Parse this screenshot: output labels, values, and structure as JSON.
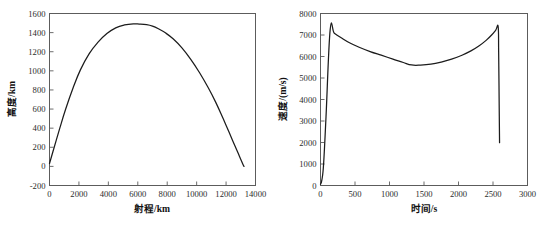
{
  "figure": {
    "background_color": "#ffffff",
    "axis_color": "#5c5c5c",
    "curve_color": "#1c1c1c",
    "panel_count": 2
  },
  "chart_data": [
    {
      "type": "line",
      "panel": "left",
      "title": "",
      "xlabel": "射程/km",
      "ylabel": "高度/km",
      "xlim": [
        0,
        14000
      ],
      "ylim": [
        -200,
        1600
      ],
      "xticks": [
        0,
        2000,
        4000,
        6000,
        8000,
        10000,
        12000,
        14000
      ],
      "yticks": [
        -200,
        0,
        200,
        400,
        600,
        800,
        1000,
        1200,
        1400,
        1600
      ],
      "xticklabels": [
        "0",
        "2000",
        "4000",
        "6000",
        "8000",
        "10000",
        "12000",
        "14000"
      ],
      "yticklabels": [
        "-200",
        "0",
        "200",
        "400",
        "600",
        "800",
        "1000",
        "1200",
        "1400",
        "1600"
      ],
      "grid": false,
      "legend": null,
      "series": [
        {
          "name": "弹道高度",
          "x": [
            0,
            300,
            700,
            1100,
            1600,
            2100,
            2700,
            3300,
            3900,
            4500,
            5100,
            5700,
            6100,
            6600,
            7000,
            7400,
            7900,
            8400,
            9000,
            9600,
            10200,
            10800,
            11300,
            11800,
            12200,
            12600,
            12900,
            13150,
            13220
          ],
          "y": [
            30,
            190,
            400,
            600,
            820,
            1010,
            1180,
            1300,
            1390,
            1450,
            1480,
            1492,
            1490,
            1483,
            1468,
            1440,
            1395,
            1335,
            1240,
            1120,
            980,
            820,
            670,
            500,
            360,
            215,
            110,
            20,
            0
          ]
        }
      ]
    },
    {
      "type": "line",
      "panel": "right",
      "title": "",
      "xlabel": "时间/s",
      "ylabel": "速度/(m/s)",
      "xlim": [
        0,
        3000
      ],
      "ylim": [
        0,
        8000
      ],
      "xticks": [
        0,
        500,
        1000,
        1500,
        2000,
        2500,
        3000
      ],
      "yticks": [
        0,
        1000,
        2000,
        3000,
        4000,
        5000,
        6000,
        7000,
        8000
      ],
      "xticklabels": [
        "0",
        "500",
        "1000",
        "1500",
        "2000",
        "2500",
        "3000"
      ],
      "yticklabels": [
        "0",
        "1000",
        "2000",
        "3000",
        "4000",
        "5000",
        "6000",
        "7000",
        "8000"
      ],
      "grid": false,
      "legend": null,
      "series": [
        {
          "name": "速度",
          "x": [
            0,
            20,
            45,
            80,
            140,
            200,
            300,
            420,
            560,
            720,
            880,
            1050,
            1200,
            1320,
            1450,
            1600,
            1750,
            1900,
            2050,
            2180,
            2300,
            2400,
            2480,
            2540,
            2575,
            2582,
            2590,
            2595
          ],
          "y": [
            60,
            260,
            1000,
            3200,
            7240,
            7080,
            6870,
            6640,
            6430,
            6230,
            6060,
            5880,
            5720,
            5605,
            5600,
            5640,
            5740,
            5880,
            6060,
            6260,
            6500,
            6750,
            7000,
            7230,
            7380,
            6200,
            3600,
            1990
          ]
        }
      ]
    }
  ]
}
